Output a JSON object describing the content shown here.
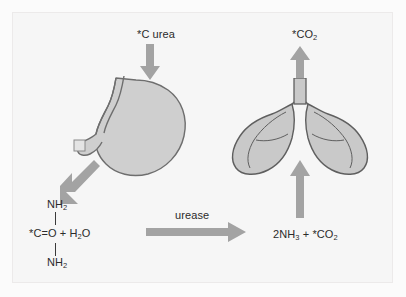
{
  "figure": {
    "background_color": "#f6f6f6",
    "frame_border_color": "#eceaea"
  },
  "labels": {
    "c_urea": "*C urea",
    "co2_exhaled": "*CO",
    "co2_exhaled_sub": "2",
    "urease": "urease",
    "nh2_top": "NH",
    "nh2_top_sub": "2",
    "nh2_bottom": "NH",
    "nh2_bottom_sub": "2",
    "urea_core_a": "*C=O + H",
    "urea_core_sub": "2",
    "urea_core_b": "O",
    "products_a": "2NH",
    "products_sub_a": "3",
    "products_b": " + *CO",
    "products_sub_b": "2"
  },
  "arrows": {
    "color": "#a3a3a3",
    "down_to_stomach": "arrow-down",
    "up_to_co2": "arrow-up",
    "diagonal_to_urea": "arrow-diagonal-down-left",
    "right_urease": "arrow-right",
    "up_to_lungs": "arrow-up"
  },
  "organs": {
    "stomach": {
      "name": "stomach",
      "fill": "#cfcfcf",
      "stroke": "#6e6e6e"
    },
    "lungs": {
      "name": "lungs",
      "fill": "#c9c9c9",
      "stroke": "#5f5f5f"
    }
  }
}
